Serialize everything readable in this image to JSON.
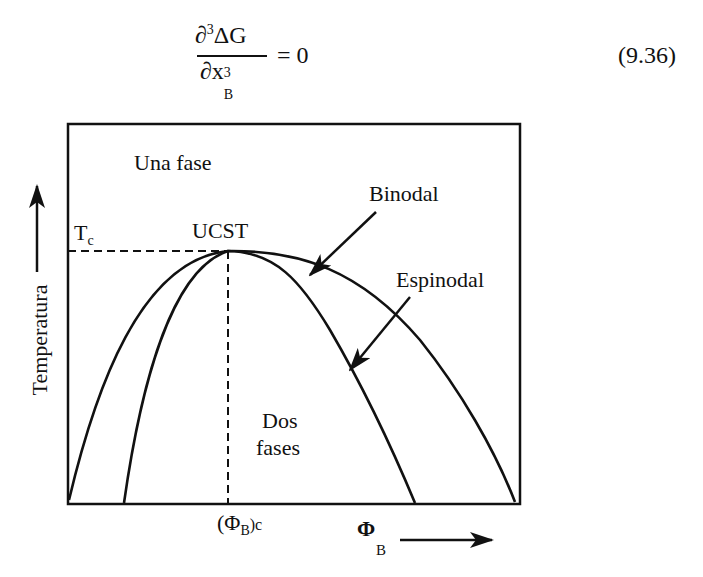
{
  "equation": {
    "numerator": "∂³ΔG",
    "numerator_parts": {
      "partial": "∂",
      "power": "3",
      "body": "ΔG"
    },
    "denominator_parts": {
      "partial": "∂x",
      "power": "3",
      "subscript": "B"
    },
    "equals": "= 0",
    "number": "(9.36)"
  },
  "diagram": {
    "region_top_label": "Una fase",
    "region_bottom_label_line1": "Dos",
    "region_bottom_label_line2": "fases",
    "critical_point_label": "UCST",
    "tc_label": "T",
    "tc_subscript": "c",
    "binodal_label": "Binodal",
    "spinodal_label": "Espinodal",
    "y_axis_label": "Temperatura",
    "x_axis_label": "Φ",
    "x_axis_subscript": "B",
    "critical_x_label_open": "(Φ",
    "critical_x_label_sub": "B",
    "critical_x_label_close": ")c",
    "colors": {
      "line": "#111111",
      "background": "#ffffff"
    }
  }
}
